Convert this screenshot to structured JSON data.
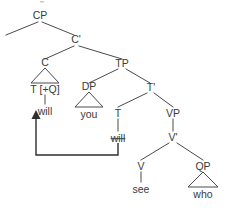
{
  "diagram": {
    "kind": "syntax-tree",
    "colors": {
      "background": "#ffffff",
      "text": "#3a3a3a",
      "branch": "#4a4a4a",
      "arrow": "#2e2e2e"
    },
    "nodes": {
      "cp": "CP",
      "cbar": "C'",
      "c": "C",
      "tp": "TP",
      "dp": "DP",
      "tbar": "T'",
      "t_q": "T [+Q]",
      "t": "T",
      "vp": "VP",
      "vbar": "V'",
      "v": "V",
      "qp": "QP"
    },
    "terminals": {
      "will_c": "will",
      "you": "you",
      "will_t_struck": "will",
      "see": "see",
      "who": "who"
    },
    "annotations": {
      "movement": "head-movement-arrow",
      "struck_item": "will"
    }
  }
}
